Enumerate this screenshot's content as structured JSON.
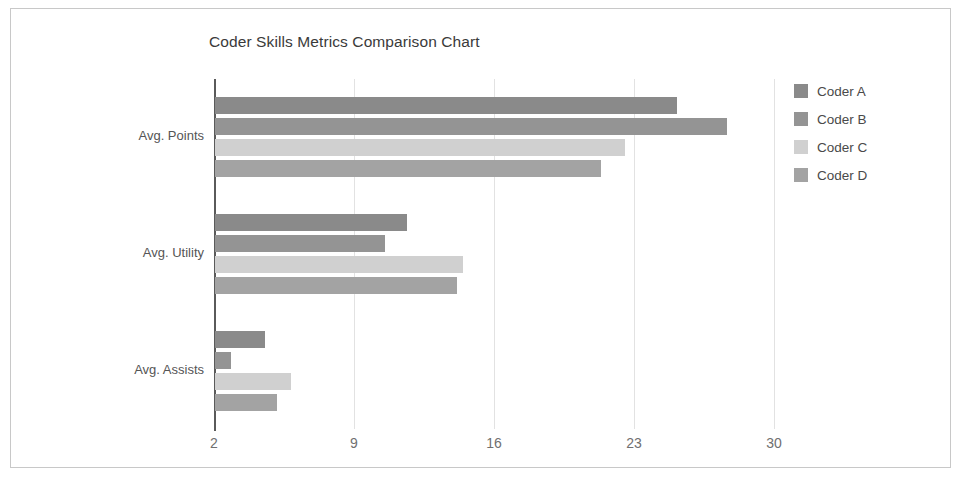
{
  "chart_data": {
    "type": "bar",
    "orientation": "horizontal",
    "title": "Coder Skills Metrics Comparison Chart",
    "xlabel": "",
    "ylabel": "",
    "categories": [
      "Avg. Points",
      "Avg. Utility",
      "Avg. Assists"
    ],
    "xticks": [
      2,
      9,
      16,
      23,
      30
    ],
    "xlim": [
      2,
      30
    ],
    "grid": true,
    "legend_position": "right",
    "series": [
      {
        "name": "Coder A",
        "color": "#8a8a8a",
        "values": [
          25.1,
          11.6,
          4.5
        ]
      },
      {
        "name": "Coder B",
        "color": "#949494",
        "values": [
          27.6,
          10.5,
          2.8
        ]
      },
      {
        "name": "Coder C",
        "color": "#d0d0d0",
        "values": [
          22.5,
          14.4,
          5.8
        ]
      },
      {
        "name": "Coder D",
        "color": "#a3a3a3",
        "values": [
          21.3,
          14.1,
          5.1
        ]
      }
    ]
  },
  "legend": {
    "items": [
      {
        "label": "Coder A"
      },
      {
        "label": "Coder B"
      },
      {
        "label": "Coder C"
      },
      {
        "label": "Coder D"
      }
    ]
  }
}
